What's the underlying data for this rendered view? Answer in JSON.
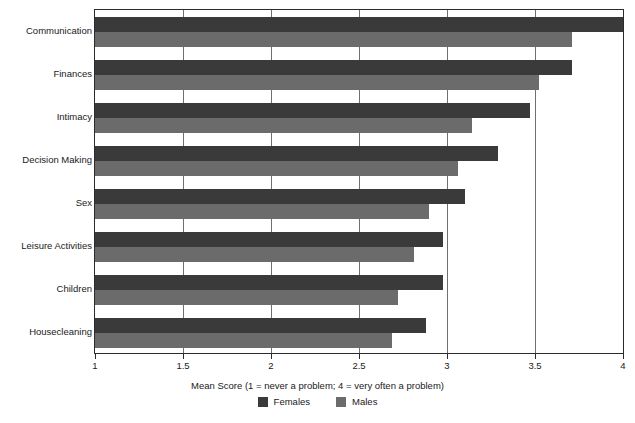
{
  "chart_data": {
    "type": "bar",
    "orientation": "horizontal",
    "title": "",
    "xlabel": "Mean Score (1 = never a problem; 4 = very often a problem)",
    "ylabel": "",
    "xlim": [
      1,
      4
    ],
    "xticks": [
      1,
      1.5,
      2,
      2.5,
      3,
      3.5,
      4
    ],
    "xtick_labels": [
      "1",
      "1.5",
      "2",
      "2.5",
      "3",
      "3.5",
      "4"
    ],
    "grid": true,
    "grid_axis": "x",
    "legend_position": "bottom",
    "categories": [
      "Communication",
      "Finances",
      "Intimacy",
      "Decision Making",
      "Sex",
      "Leisure Activities",
      "Children",
      "Housecleaning"
    ],
    "series": [
      {
        "name": "Females",
        "color": "#3a3a3a",
        "values": [
          4.0,
          3.71,
          3.47,
          3.29,
          3.1,
          2.98,
          2.98,
          2.88
        ]
      },
      {
        "name": "Males",
        "color": "#6b6b6b",
        "values": [
          3.71,
          3.52,
          3.14,
          3.06,
          2.9,
          2.81,
          2.72,
          2.69
        ]
      }
    ]
  },
  "axis": {
    "x_title": "Mean Score (1 = never a problem; 4 = very often a problem)"
  },
  "legend": {
    "items": [
      {
        "label": "Females",
        "color": "#3a3a3a"
      },
      {
        "label": "Males",
        "color": "#6b6b6b"
      }
    ]
  },
  "colors": {
    "female_bar": "#3a3a3a",
    "male_bar": "#6b6b6b",
    "frame": "#2b2b2b",
    "gridline": "#6f6f6f",
    "background": "#ffffff"
  }
}
